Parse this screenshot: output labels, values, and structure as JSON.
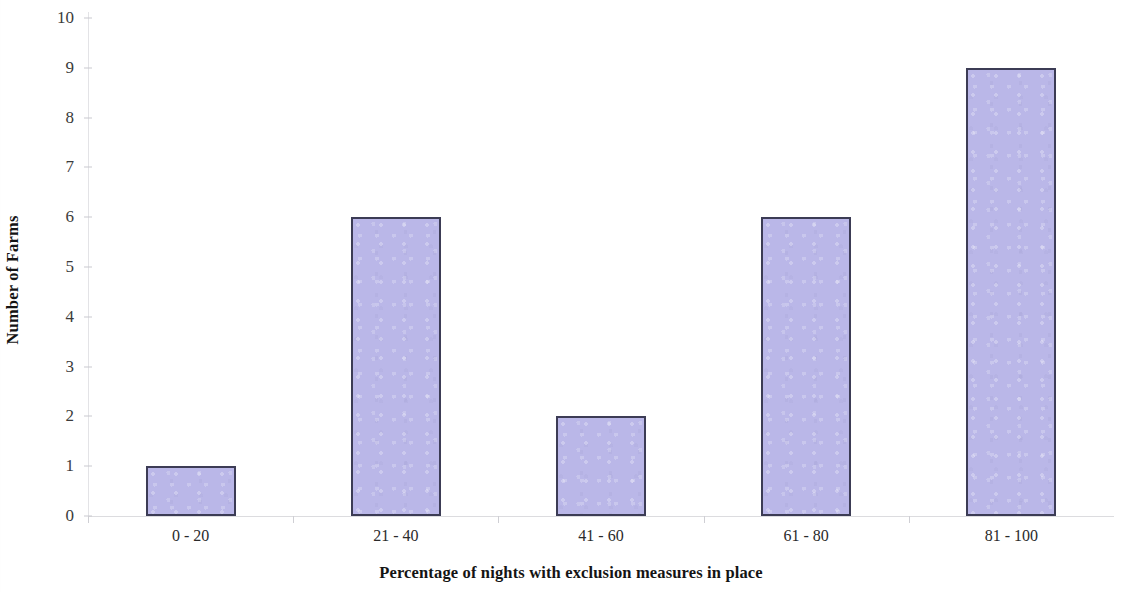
{
  "chart_data": {
    "type": "bar",
    "title": "",
    "subtitle": "",
    "xlabel": "Percentage of nights with exclusion measures in place",
    "ylabel": "Number of Farms",
    "categories": [
      "0 - 20",
      "21 - 40",
      "41 - 60",
      "61 - 80",
      "81 - 100"
    ],
    "values": [
      1,
      6,
      2,
      6,
      9
    ],
    "series": [
      {
        "name": "Number of Farms",
        "values": [
          1,
          6,
          2,
          6,
          9
        ]
      }
    ],
    "ylim": [
      0,
      10
    ],
    "y_ticks": [
      0,
      1,
      2,
      3,
      4,
      5,
      6,
      7,
      8,
      9,
      10
    ],
    "y_tick_labels": [
      "0",
      "1",
      "2",
      "3",
      "4",
      "5",
      "6",
      "7",
      "8",
      "9",
      "10"
    ],
    "grid": false,
    "legend": "none",
    "colors": {
      "bar_fill": "#bab7e8",
      "bar_border": "#3c3c55",
      "axis_line": "#dcdcdf",
      "text": "#141414",
      "background": "#ffffff"
    }
  },
  "axis": {
    "y_title": "Number of Farms",
    "x_title": "Percentage of nights with exclusion measures in place"
  }
}
